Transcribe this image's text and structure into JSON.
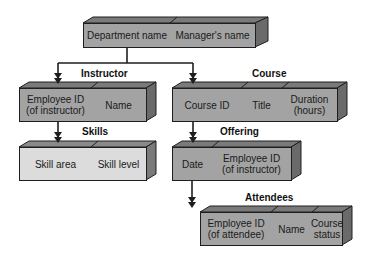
{
  "diagram": {
    "colors": {
      "face_dark": "#a3a3a3",
      "face_light": "#dcdcdc",
      "top": "#7a7a7a",
      "side": "#6a6a6a",
      "line": "#1e1e1e"
    },
    "nodes": {
      "department": {
        "label": "",
        "fields": [
          "Department name",
          "Manager's name"
        ]
      },
      "instructor": {
        "label": "Instructor",
        "fields": [
          "Employee ID\n(of instructor)",
          "Name"
        ]
      },
      "course": {
        "label": "Course",
        "fields": [
          "Course ID",
          "Title",
          "Duration\n(hours)"
        ]
      },
      "skills": {
        "label": "Skills",
        "fields": [
          "Skill area",
          "Skill level"
        ]
      },
      "offering": {
        "label": "Offering",
        "fields": [
          "Date",
          "Employee ID\n(of instructor)"
        ]
      },
      "attendees": {
        "label": "Attendees",
        "fields": [
          "Employee ID\n(of attendee)",
          "Name",
          "Course\nstatus"
        ]
      }
    },
    "edges": [
      {
        "from": "department",
        "to": "instructor"
      },
      {
        "from": "department",
        "to": "course"
      },
      {
        "from": "instructor",
        "to": "skills"
      },
      {
        "from": "course",
        "to": "offering"
      },
      {
        "from": "offering",
        "to": "attendees"
      }
    ]
  }
}
